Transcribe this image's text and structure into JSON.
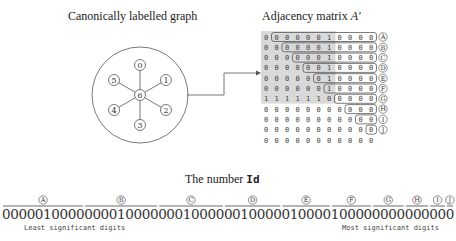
{
  "titles": {
    "graph": "Canonically labelled graph",
    "matrix_prefix": "Adjacency matrix ",
    "matrix_symbol": "A′",
    "number_prefix": "The number ",
    "number_symbol": "Id"
  },
  "graph": {
    "center_node": "6",
    "outer_nodes": [
      "0",
      "1",
      "2",
      "3",
      "4",
      "5"
    ]
  },
  "matrix": {
    "row_labels": [
      "A",
      "B",
      "C",
      "D",
      "E",
      "F",
      "G",
      "H",
      "I",
      "J",
      ""
    ],
    "rows": [
      [
        "0",
        "0",
        "0",
        "0",
        "0",
        "0",
        "1",
        "0",
        "0",
        "0",
        "0"
      ],
      [
        "0",
        "0",
        "0",
        "0",
        "0",
        "0",
        "1",
        "0",
        "0",
        "0",
        "0"
      ],
      [
        "0",
        "0",
        "0",
        "0",
        "0",
        "0",
        "1",
        "0",
        "0",
        "0",
        "0"
      ],
      [
        "0",
        "0",
        "0",
        "0",
        "0",
        "0",
        "1",
        "0",
        "0",
        "0",
        "0"
      ],
      [
        "0",
        "0",
        "0",
        "0",
        "0",
        "0",
        "1",
        "0",
        "0",
        "0",
        "0"
      ],
      [
        "0",
        "0",
        "0",
        "0",
        "0",
        "0",
        "1",
        "0",
        "0",
        "0",
        "0"
      ],
      [
        "1",
        "1",
        "1",
        "1",
        "1",
        "1",
        "0",
        "0",
        "0",
        "0",
        "0"
      ],
      [
        "0",
        "0",
        "0",
        "0",
        "0",
        "0",
        "0",
        "0",
        "0",
        "0",
        "0"
      ],
      [
        "0",
        "0",
        "0",
        "0",
        "0",
        "0",
        "0",
        "0",
        "0",
        "0",
        "0"
      ],
      [
        "0",
        "0",
        "0",
        "0",
        "0",
        "0",
        "0",
        "0",
        "0",
        "0",
        "0"
      ],
      [
        "0",
        "0",
        "0",
        "0",
        "0",
        "0",
        "0",
        "0",
        "0",
        "0",
        "0"
      ]
    ]
  },
  "number": {
    "groups": [
      {
        "label": "A",
        "digits": "0000010000"
      },
      {
        "label": "B",
        "digits": "000010000"
      },
      {
        "label": "C",
        "digits": "00010000"
      },
      {
        "label": "D",
        "digits": "0010000"
      },
      {
        "label": "E",
        "digits": "010000"
      },
      {
        "label": "F",
        "digits": "10000"
      },
      {
        "label": "G",
        "digits": "0000"
      },
      {
        "label": "H",
        "digits": "000"
      },
      {
        "label": "I",
        "digits": "00"
      },
      {
        "label": "J",
        "digits": "0"
      }
    ],
    "least_significant_label": "Least significant digits",
    "most_significant_label": "Most significant digits"
  },
  "colors": {
    "shade": "#d9d9d9",
    "stroke": "#555555"
  }
}
